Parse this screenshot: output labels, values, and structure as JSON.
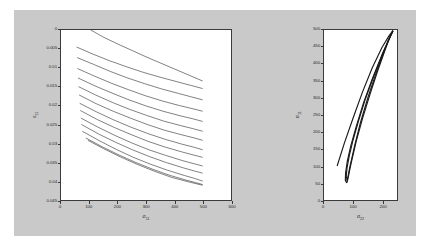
{
  "figure": {
    "background_color": "#c9c9c9",
    "page_background": "#ffffff",
    "axes_color": "#3a3a3a",
    "line_color": "#1a1a1a"
  },
  "chart_data": [
    {
      "id": "left-plot",
      "type": "line",
      "title": "",
      "xlabel": "sigma_11",
      "xlabel_base": "σ",
      "xlabel_sub": "11",
      "ylabel": "epsilon_11",
      "ylabel_base": "ε",
      "ylabel_sub": "11",
      "xlim": [
        0,
        600
      ],
      "ylim": [
        0,
        0.045
      ],
      "y_inverted": true,
      "grid": false,
      "legend": "none",
      "xticks": [
        0,
        100,
        200,
        300,
        400,
        500,
        600
      ],
      "xticklabels": [
        "0",
        "100",
        "200",
        "300",
        "400",
        "500",
        "600"
      ],
      "yticks": [
        0,
        0.005,
        0.01,
        0.015,
        0.02,
        0.025,
        0.03,
        0.035,
        0.04,
        0.045
      ],
      "yticklabels": [
        "0",
        "0.005",
        "0.01",
        "0.015",
        "0.02",
        "0.025",
        "0.03",
        "0.035",
        "0.04",
        "0.045"
      ],
      "series": [
        {
          "name": "curve-1",
          "x": [
            105,
            150,
            200,
            250,
            300,
            350,
            400,
            450,
            500
          ],
          "y": [
            0.0,
            0.0019,
            0.0037,
            0.0054,
            0.0071,
            0.0087,
            0.0103,
            0.0119,
            0.0135
          ]
        },
        {
          "name": "curve-2",
          "x": [
            55,
            110,
            170,
            230,
            290,
            350,
            410,
            460,
            500
          ],
          "y": [
            0.0045,
            0.0063,
            0.0081,
            0.0097,
            0.0112,
            0.0125,
            0.0137,
            0.0147,
            0.0155
          ]
        },
        {
          "name": "curve-3",
          "x": [
            57,
            115,
            175,
            235,
            295,
            355,
            415,
            460,
            500
          ],
          "y": [
            0.0073,
            0.0091,
            0.011,
            0.0127,
            0.0142,
            0.0156,
            0.0168,
            0.0177,
            0.0185
          ]
        },
        {
          "name": "curve-4",
          "x": [
            58,
            118,
            178,
            238,
            298,
            358,
            418,
            462,
            500
          ],
          "y": [
            0.0102,
            0.0122,
            0.0141,
            0.0158,
            0.0174,
            0.0188,
            0.02,
            0.0208,
            0.0215
          ]
        },
        {
          "name": "curve-5",
          "x": [
            60,
            120,
            180,
            240,
            300,
            360,
            420,
            465,
            500
          ],
          "y": [
            0.0127,
            0.0148,
            0.0167,
            0.0185,
            0.0201,
            0.0215,
            0.0227,
            0.0235,
            0.0242
          ]
        },
        {
          "name": "curve-6",
          "x": [
            62,
            122,
            182,
            242,
            302,
            362,
            422,
            465,
            500
          ],
          "y": [
            0.015,
            0.0172,
            0.0192,
            0.021,
            0.0226,
            0.0241,
            0.0253,
            0.0261,
            0.0268
          ]
        },
        {
          "name": "curve-7",
          "x": [
            64,
            124,
            184,
            244,
            304,
            364,
            424,
            466,
            500
          ],
          "y": [
            0.0172,
            0.0195,
            0.0215,
            0.0233,
            0.025,
            0.0265,
            0.0277,
            0.0285,
            0.0292
          ]
        },
        {
          "name": "curve-8",
          "x": [
            66,
            126,
            186,
            246,
            306,
            366,
            426,
            468,
            500
          ],
          "y": [
            0.0194,
            0.0217,
            0.0238,
            0.0257,
            0.0274,
            0.0289,
            0.0302,
            0.031,
            0.0317
          ]
        },
        {
          "name": "curve-9",
          "x": [
            68,
            128,
            188,
            248,
            308,
            368,
            428,
            468,
            500
          ],
          "y": [
            0.0213,
            0.0237,
            0.0258,
            0.0277,
            0.0295,
            0.031,
            0.0323,
            0.0331,
            0.0337
          ]
        },
        {
          "name": "curve-10",
          "x": [
            70,
            130,
            190,
            250,
            310,
            370,
            430,
            470,
            500
          ],
          "y": [
            0.0233,
            0.0257,
            0.0279,
            0.0299,
            0.0317,
            0.0332,
            0.0346,
            0.0354,
            0.036
          ]
        },
        {
          "name": "curve-11",
          "x": [
            72,
            132,
            192,
            252,
            312,
            372,
            432,
            470,
            500
          ],
          "y": [
            0.025,
            0.0275,
            0.0297,
            0.0317,
            0.0335,
            0.0351,
            0.0365,
            0.0373,
            0.0379
          ]
        },
        {
          "name": "curve-12",
          "x": [
            75,
            135,
            195,
            255,
            315,
            375,
            435,
            472,
            500
          ],
          "y": [
            0.0268,
            0.0293,
            0.0316,
            0.0337,
            0.0355,
            0.0371,
            0.0385,
            0.0393,
            0.04
          ]
        },
        {
          "name": "curve-13",
          "x": [
            88,
            145,
            205,
            265,
            325,
            385,
            440,
            475,
            500
          ],
          "y": [
            0.0286,
            0.0309,
            0.0331,
            0.0351,
            0.0369,
            0.0385,
            0.0397,
            0.0404,
            0.0409
          ]
        },
        {
          "name": "curve-14",
          "x": [
            95,
            150,
            210,
            270,
            330,
            390,
            445,
            478,
            500
          ],
          "y": [
            0.0292,
            0.0314,
            0.0336,
            0.0356,
            0.0374,
            0.039,
            0.0401,
            0.0407,
            0.0411
          ]
        }
      ]
    },
    {
      "id": "right-plot",
      "type": "line",
      "title": "",
      "xlabel": "sigma_22",
      "xlabel_base": "σ",
      "xlabel_sub": "22",
      "ylabel": "sigma_11",
      "ylabel_base": "σ",
      "ylabel_sub": "11",
      "xlim": [
        0,
        250
      ],
      "ylim": [
        0,
        500
      ],
      "y_inverted": false,
      "grid": false,
      "legend": "none",
      "xticks": [
        0,
        100,
        200
      ],
      "xticklabels": [
        "0",
        "100",
        "200"
      ],
      "yticks": [
        0,
        50,
        100,
        150,
        200,
        250,
        300,
        350,
        400,
        450,
        500
      ],
      "yticklabels": [
        "0",
        "50",
        "100",
        "150",
        "200",
        "250",
        "300",
        "350",
        "400",
        "450",
        "500"
      ],
      "series": [
        {
          "name": "loop-outer-lower",
          "x": [
            236,
            200,
            165,
            135,
            110,
            92,
            80,
            74,
            73,
            78
          ],
          "y": [
            498,
            430,
            355,
            285,
            215,
            160,
            115,
            80,
            58,
            50
          ]
        },
        {
          "name": "loop-outer-upper",
          "x": [
            78,
            88,
            105,
            125,
            150,
            175,
            200,
            220,
            236
          ],
          "y": [
            50,
            95,
            160,
            228,
            300,
            365,
            425,
            470,
            498
          ]
        },
        {
          "name": "loop-inner-lower",
          "x": [
            236,
            205,
            172,
            142,
            118,
            100,
            87,
            79,
            76,
            80
          ],
          "y": [
            498,
            438,
            368,
            298,
            232,
            178,
            132,
            95,
            70,
            55
          ]
        },
        {
          "name": "loop-inner-upper",
          "x": [
            80,
            92,
            110,
            132,
            158,
            183,
            207,
            224,
            236
          ],
          "y": [
            55,
            105,
            172,
            240,
            312,
            378,
            436,
            476,
            498
          ]
        },
        {
          "name": "thin-trace",
          "x": [
            45,
            70,
            100,
            132,
            165,
            198,
            222,
            236
          ],
          "y": [
            100,
            168,
            242,
            318,
            388,
            448,
            482,
            498
          ]
        }
      ]
    }
  ]
}
